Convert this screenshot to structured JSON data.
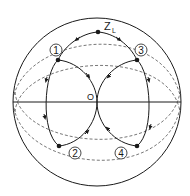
{
  "diagram": {
    "type": "smith-chart-matching-paths",
    "colors": {
      "line": "#1a1a1a",
      "dashed": "#555555",
      "background": "#ffffff"
    },
    "labels": {
      "load": "Z",
      "load_sub": "L",
      "origin": "O",
      "points": [
        "1",
        "2",
        "3",
        "4"
      ]
    },
    "points": [
      {
        "id": "ZL",
        "x": 98,
        "y": 32
      },
      {
        "id": "1",
        "x": 58,
        "y": 60
      },
      {
        "id": "2",
        "x": 59,
        "y": 146
      },
      {
        "id": "3",
        "x": 137,
        "y": 60
      },
      {
        "id": "4",
        "x": 137,
        "y": 146
      },
      {
        "id": "O",
        "x": 97,
        "y": 102
      }
    ]
  }
}
